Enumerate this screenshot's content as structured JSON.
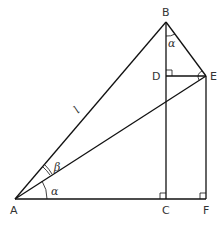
{
  "diagram": {
    "points": {
      "A": {
        "label": "A",
        "x": 15,
        "y": 199
      },
      "B": {
        "label": "B",
        "x": 166,
        "y": 22
      },
      "C": {
        "label": "C",
        "x": 166,
        "y": 199
      },
      "D": {
        "label": "D",
        "x": 166,
        "y": 76
      },
      "E": {
        "label": "E",
        "x": 206,
        "y": 76
      },
      "F": {
        "label": "F",
        "x": 206,
        "y": 199
      }
    },
    "segments": [
      "AB",
      "AE",
      "AC",
      "CF",
      "BC",
      "BE",
      "DE",
      "EF"
    ],
    "side_labels": {
      "AB": "l"
    },
    "angle_labels": {
      "alpha_at_A": "α",
      "beta_at_A": "β",
      "alpha_at_B": "α"
    },
    "right_angles": [
      "D",
      "E",
      "C",
      "F"
    ]
  }
}
